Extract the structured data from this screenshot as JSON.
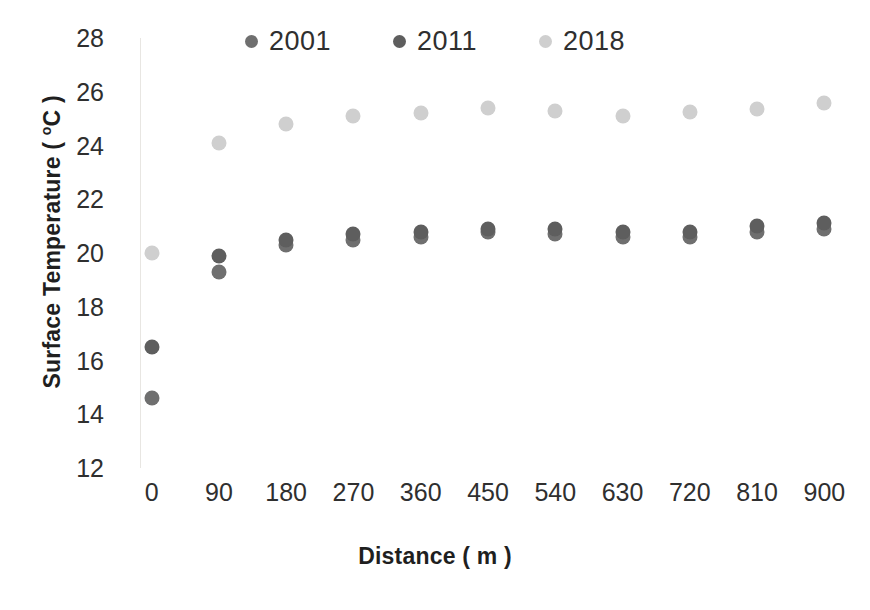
{
  "chart_data": {
    "type": "scatter",
    "title": "",
    "xlabel": "Distance ( m )",
    "ylabel": "Surface Temperature (°C )",
    "ylabel_main": "Surface Temperature ( ",
    "ylabel_unit": "o",
    "ylabel_tail": "C )",
    "x": [
      0,
      90,
      180,
      270,
      360,
      450,
      540,
      630,
      720,
      810,
      900
    ],
    "xlim": [
      -45,
      945
    ],
    "ylim": [
      12,
      28
    ],
    "xticks": [
      "0",
      "90",
      "180",
      "270",
      "360",
      "450",
      "540",
      "630",
      "720",
      "810",
      "900"
    ],
    "yticks": [
      "12",
      "14",
      "16",
      "18",
      "20",
      "22",
      "24",
      "26",
      "28"
    ],
    "grid": false,
    "legend_position": "top-center",
    "series": [
      {
        "name": "2001",
        "color": "#6f6f6f",
        "values": [
          14.6,
          19.3,
          20.3,
          20.5,
          20.6,
          20.8,
          20.7,
          20.6,
          20.6,
          20.8,
          20.9
        ]
      },
      {
        "name": "2011",
        "color": "#5e5e5e",
        "values": [
          16.5,
          19.9,
          20.5,
          20.7,
          20.8,
          20.9,
          20.9,
          20.8,
          20.8,
          21.0,
          21.1
        ]
      },
      {
        "name": "2018",
        "color": "#cfcfcf",
        "values": [
          20.0,
          24.1,
          24.8,
          25.1,
          25.2,
          25.4,
          25.3,
          25.1,
          25.25,
          25.35,
          25.6
        ]
      }
    ]
  }
}
